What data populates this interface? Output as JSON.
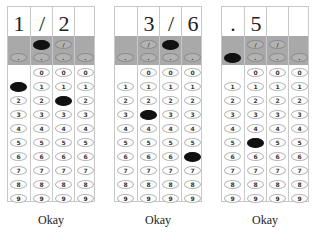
{
  "grids": [
    {
      "header": [
        "1",
        "/",
        "2",
        ""
      ],
      "filled": {
        "slash": [
          false,
          true,
          false,
          false
        ],
        "decimal": [
          false,
          false,
          false,
          false
        ],
        "digits": [
          1,
          null,
          2,
          null
        ]
      },
      "slash_cols": [
        1,
        2
      ],
      "zero_from_col": 1,
      "label": "Okay"
    },
    {
      "header": [
        "",
        "3",
        "/",
        "6"
      ],
      "filled": {
        "slash": [
          false,
          false,
          true,
          false
        ],
        "decimal": [
          false,
          false,
          false,
          false
        ],
        "digits": [
          null,
          3,
          null,
          6
        ]
      },
      "slash_cols": [
        1,
        2
      ],
      "zero_from_col": 1,
      "label": "Okay"
    },
    {
      "header": [
        ".",
        "5",
        "",
        ""
      ],
      "filled": {
        "slash": [
          false,
          false,
          false,
          false
        ],
        "decimal": [
          true,
          false,
          false,
          false
        ],
        "digits": [
          null,
          5,
          null,
          null
        ]
      },
      "slash_cols": [
        1,
        2
      ],
      "zero_from_col": 1,
      "label": "Okay"
    }
  ],
  "symbols": {
    "slash": "/",
    "decimal": "."
  },
  "digits": [
    "0",
    "1",
    "2",
    "3",
    "4",
    "5",
    "6",
    "7",
    "8",
    "9"
  ]
}
